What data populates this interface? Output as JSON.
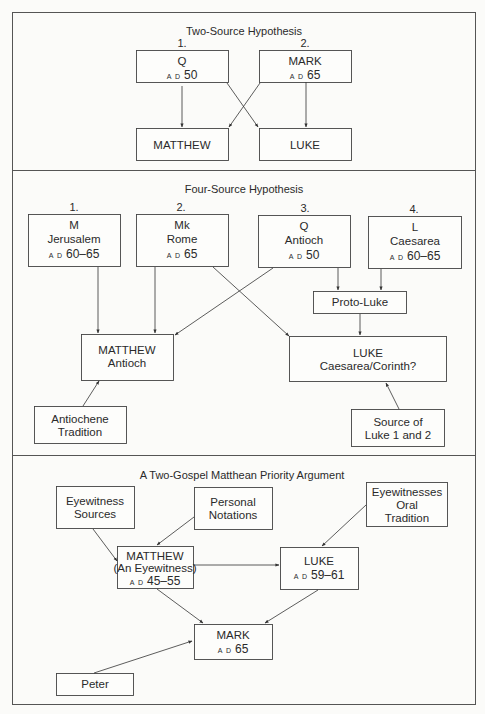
{
  "sections": [
    {
      "title": "Two-Source Hypothesis",
      "nodes": [
        {
          "id": "q",
          "number": "1.",
          "lines": [
            "Q"
          ],
          "ad": "A D",
          "year": "50"
        },
        {
          "id": "mark",
          "number": "2.",
          "lines": [
            "MARK"
          ],
          "ad": "A D",
          "year": "65"
        },
        {
          "id": "matthew",
          "lines": [
            "MATTHEW"
          ]
        },
        {
          "id": "luke",
          "lines": [
            "LUKE"
          ]
        }
      ],
      "edges": [
        [
          "q",
          "matthew"
        ],
        [
          "q",
          "luke"
        ],
        [
          "mark",
          "matthew"
        ],
        [
          "mark",
          "luke"
        ]
      ]
    },
    {
      "title": "Four-Source Hypothesis",
      "nodes": [
        {
          "id": "m",
          "number": "1.",
          "lines": [
            "M",
            "Jerusalem"
          ],
          "ad": "A D",
          "year": "60–65"
        },
        {
          "id": "mk",
          "number": "2.",
          "lines": [
            "Mk",
            "Rome"
          ],
          "ad": "A D",
          "year": "65"
        },
        {
          "id": "q",
          "number": "3.",
          "lines": [
            "Q",
            "Antioch"
          ],
          "ad": "A D",
          "year": "50"
        },
        {
          "id": "l",
          "number": "4.",
          "lines": [
            "L",
            "Caesarea"
          ],
          "ad": "A D",
          "year": "60–65"
        },
        {
          "id": "protoluke",
          "lines": [
            "Proto-Luke"
          ]
        },
        {
          "id": "matthew",
          "lines": [
            "MATTHEW",
            "Antioch"
          ]
        },
        {
          "id": "luke",
          "lines": [
            "LUKE",
            "Caesarea/Corinth?"
          ]
        },
        {
          "id": "antiochene",
          "lines": [
            "Antiochene",
            "Tradition"
          ]
        },
        {
          "id": "source12",
          "lines": [
            "Source of",
            "Luke 1 and 2"
          ]
        }
      ],
      "edges": [
        [
          "m",
          "matthew"
        ],
        [
          "mk",
          "matthew"
        ],
        [
          "mk",
          "luke"
        ],
        [
          "q",
          "matthew"
        ],
        [
          "q",
          "protoluke"
        ],
        [
          "l",
          "protoluke"
        ],
        [
          "protoluke",
          "luke"
        ],
        [
          "antiochene",
          "matthew"
        ],
        [
          "source12",
          "luke"
        ]
      ]
    },
    {
      "title": "A Two-Gospel Matthean Priority Argument",
      "nodes": [
        {
          "id": "eyesources",
          "lines": [
            "Eyewitness",
            "Sources"
          ]
        },
        {
          "id": "notations",
          "lines": [
            "Personal",
            "Notations"
          ]
        },
        {
          "id": "eyeoral",
          "lines": [
            "Eyewitnesses",
            "Oral",
            "Tradition"
          ]
        },
        {
          "id": "matthew",
          "lines": [
            "MATTHEW",
            "(An Eyewitness)"
          ],
          "ad": "A D",
          "year": "45–55"
        },
        {
          "id": "luke",
          "lines": [
            "LUKE"
          ],
          "ad": "A D",
          "year": "59–61"
        },
        {
          "id": "mark",
          "lines": [
            "MARK"
          ],
          "ad": "A D",
          "year": "65"
        },
        {
          "id": "peter",
          "lines": [
            "Peter"
          ]
        }
      ],
      "edges": [
        [
          "eyesources",
          "matthew"
        ],
        [
          "notations",
          "matthew"
        ],
        [
          "eyeoral",
          "luke"
        ],
        [
          "matthew",
          "luke"
        ],
        [
          "matthew",
          "mark"
        ],
        [
          "luke",
          "mark"
        ],
        [
          "peter",
          "mark"
        ]
      ]
    }
  ]
}
